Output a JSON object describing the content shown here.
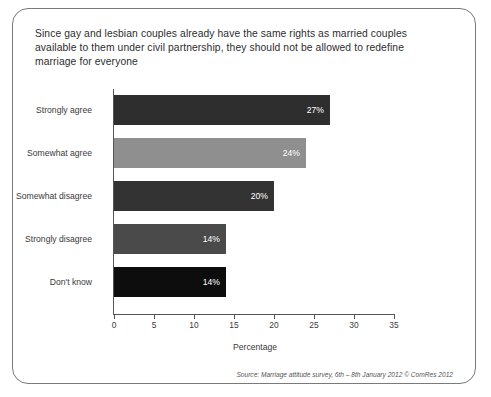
{
  "chart_data": {
    "type": "bar",
    "orientation": "horizontal",
    "title": "Since gay and lesbian couples already have the same rights as married couples available to them under civil partnership, they should not be allowed to redefine marriage for everyone",
    "categories": [
      "Strongly agree",
      "Somewhat agree",
      "Somewhat disagree",
      "Strongly disagree",
      "Don't know"
    ],
    "values": [
      27,
      24,
      20,
      14,
      14
    ],
    "data_labels": [
      "27%",
      "24%",
      "20%",
      "14%",
      "14%"
    ],
    "bar_colors": [
      "#2e2e2e",
      "#8f8f8f",
      "#333333",
      "#4a4a4a",
      "#0d0d0d"
    ],
    "xlabel": "Percentage",
    "ylabel": "",
    "xlim": [
      0,
      35
    ],
    "xticks": [
      0,
      5,
      10,
      15,
      20,
      25,
      30,
      35
    ],
    "xtick_labels": [
      "0",
      "5",
      "10",
      "15",
      "20",
      "25",
      "30",
      "35"
    ],
    "grid": false,
    "legend": false
  },
  "footer": {
    "source": "Source: Marriage attitude survey, 6th – 8th January 2012 © ComRes 2012"
  },
  "style": {
    "card_border": "#7a7a7a",
    "axis_color": "#555555",
    "text_color": "#3a3a3a",
    "background": "#ffffff"
  }
}
